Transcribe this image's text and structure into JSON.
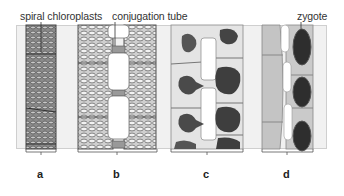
{
  "figure": {
    "labels": {
      "spiral_chloroplasts": "spiral chloroplasts",
      "conjugation_tube": "conjugation tube",
      "zygote": "zygote"
    },
    "panels": [
      {
        "id": "a",
        "letter": "a"
      },
      {
        "id": "b",
        "letter": "b"
      },
      {
        "id": "c",
        "letter": "c"
      },
      {
        "id": "d",
        "letter": "d"
      }
    ],
    "colors": {
      "background": "#f1f1f1",
      "cell_fill": "#bdbdbd",
      "chloroplast": "#5a5a5a",
      "zygote": "#2e2e2e",
      "wall": "#6f6f6f"
    }
  }
}
